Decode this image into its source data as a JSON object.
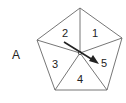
{
  "figure": {
    "panel_label": "A",
    "segments": [
      {
        "id": 1,
        "label": "1"
      },
      {
        "id": 2,
        "label": "2"
      },
      {
        "id": 3,
        "label": "3"
      },
      {
        "id": 4,
        "label": "4"
      },
      {
        "id": 5,
        "label": "5"
      }
    ],
    "arrow": {
      "from_segment": "2",
      "to_segment": "5",
      "icon": "arrow-icon"
    },
    "colors": {
      "stroke": "#555555",
      "arrow": "#222222",
      "background": "#ffffff"
    }
  }
}
